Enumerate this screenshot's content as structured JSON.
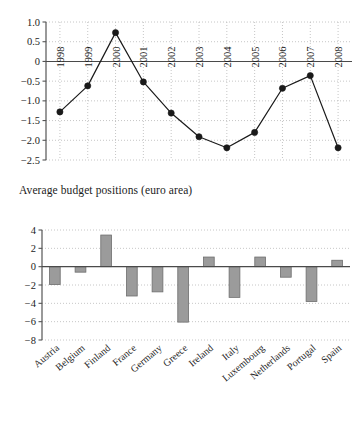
{
  "chart_data": [
    {
      "type": "line",
      "title": "",
      "caption": "Average budget positions (euro area)",
      "xlabel": "",
      "ylabel": "",
      "categories": [
        "1998",
        "1999",
        "2000",
        "2001",
        "2002",
        "2003",
        "2004",
        "2005",
        "2006",
        "2007",
        "2008"
      ],
      "values": [
        -1.28,
        -0.62,
        0.73,
        -0.52,
        -1.31,
        -1.91,
        -2.19,
        -1.8,
        -0.68,
        -0.36,
        -2.19
      ],
      "ytick_labels": [
        "1.0",
        "0.5",
        "0",
        "−0.5",
        "−1.0",
        "−1.5",
        "−2.0",
        "−2.5"
      ],
      "ytick_values": [
        1.0,
        0.5,
        0,
        -0.5,
        -1.0,
        -1.5,
        -2.0,
        -2.5
      ],
      "ylim": [
        -2.5,
        1.0
      ],
      "grid": true,
      "legend": "none",
      "marker": "filled-circle",
      "line_color": "#1a1a1a",
      "marker_color": "#1a1a1a",
      "grid_color": "#b8b8b8",
      "axis_color": "#555555",
      "zero_line": true
    },
    {
      "type": "bar",
      "title": "",
      "caption": "Average budget positions 2002–2007",
      "xlabel": "",
      "ylabel": "",
      "categories": [
        "Austria",
        "Belgium",
        "Finland",
        "France",
        "Germany",
        "Greece",
        "Ireland",
        "Italy",
        "Luxembourg",
        "Netherlands",
        "Portugal",
        "Spain"
      ],
      "values": [
        -1.95,
        -0.6,
        3.45,
        -3.2,
        -2.75,
        -6.05,
        1.05,
        -3.35,
        1.05,
        -1.15,
        -3.8,
        0.7
      ],
      "ytick_labels": [
        "4",
        "2",
        "0",
        "−2",
        "−4",
        "−6",
        "−8"
      ],
      "ytick_values": [
        4,
        2,
        0,
        -2,
        -4,
        -6,
        -8
      ],
      "ylim": [
        -8,
        4
      ],
      "grid": true,
      "legend": "none",
      "bar_fill": "#9b9b9b",
      "bar_stroke": "#6e6e6e",
      "grid_color": "#b8b8b8",
      "axis_color": "#555555",
      "zero_line": true
    }
  ]
}
